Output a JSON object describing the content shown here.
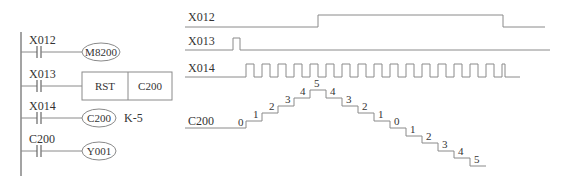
{
  "ladder": {
    "rungs": [
      {
        "contact": "X012",
        "coil": "M8200",
        "coil_type": "coil"
      },
      {
        "contact": "X013",
        "instruction": "RST",
        "operand": "C200",
        "coil_type": "box"
      },
      {
        "contact": "X014",
        "coil": "C200",
        "setting": "K-5",
        "coil_type": "coil"
      },
      {
        "contact": "C200",
        "coil": "Y001",
        "coil_type": "coil"
      }
    ]
  },
  "timing": {
    "signals": [
      {
        "name": "X012",
        "description": "direction control (M8200 up/down)"
      },
      {
        "name": "X013",
        "description": "reset pulse"
      },
      {
        "name": "X014",
        "description": "count pulses",
        "pulse_count": 16
      },
      {
        "name": "C200",
        "description": "counter current value"
      }
    ],
    "c200_values": [
      "0",
      "1",
      "2",
      "3",
      "4",
      "5",
      "4",
      "3",
      "2",
      "1",
      "0",
      "1",
      "2",
      "3",
      "4",
      "5"
    ]
  }
}
